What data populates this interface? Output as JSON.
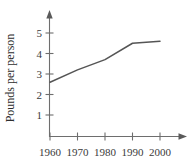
{
  "chart_data": {
    "type": "line",
    "title": "",
    "subtitle": "",
    "xlabel": "",
    "ylabel": "Pounds per person",
    "x": [
      1960,
      1970,
      1980,
      1990,
      2000
    ],
    "values": [
      2.6,
      3.2,
      3.7,
      4.5,
      4.6
    ],
    "series": [
      {
        "name": "Pounds per person",
        "values": [
          2.6,
          3.2,
          3.7,
          4.5,
          4.6
        ]
      }
    ],
    "categories": [
      "1960",
      "1970",
      "1980",
      "1990",
      "2000"
    ],
    "xtick_labels": [
      "1960",
      "1970",
      "1980",
      "1990",
      "2000"
    ],
    "ytick_labels": [
      "1",
      "2",
      "3",
      "4",
      "5"
    ],
    "ytick_values": [
      1,
      2,
      3,
      4,
      5
    ],
    "xlim": [
      1955,
      2005
    ],
    "ylim": [
      0,
      5.7
    ],
    "grid": false,
    "legend": false,
    "legend_position": "none",
    "annotations": [],
    "line_color": "#555555",
    "axis_color": "#6e6e6e",
    "axis_arrows": [
      "x-right",
      "y-up"
    ]
  },
  "axis": {
    "y_title": "Pounds per person",
    "y_ticks": [
      "5",
      "4",
      "3",
      "2",
      "1"
    ],
    "x_ticks": [
      "1960",
      "1970",
      "1980",
      "1990",
      "2000"
    ]
  }
}
